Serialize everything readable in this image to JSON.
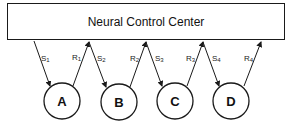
{
  "diagram": {
    "title": "Neural Control Center",
    "colors": {
      "stroke": "#1a1a1a",
      "background": "#ffffff"
    },
    "nodes": [
      {
        "id": "A",
        "label": "A"
      },
      {
        "id": "B",
        "label": "B"
      },
      {
        "id": "C",
        "label": "C"
      },
      {
        "id": "D",
        "label": "D"
      }
    ],
    "edges": [
      {
        "label": "S",
        "sub": "1",
        "from": "Neural Control Center",
        "to": "A"
      },
      {
        "label": "R",
        "sub": "1",
        "from": "A",
        "to": "Neural Control Center"
      },
      {
        "label": "S",
        "sub": "2",
        "from": "Neural Control Center",
        "to": "B"
      },
      {
        "label": "R",
        "sub": "2",
        "from": "B",
        "to": "Neural Control Center"
      },
      {
        "label": "S",
        "sub": "3",
        "from": "Neural Control Center",
        "to": "C"
      },
      {
        "label": "R",
        "sub": "3",
        "from": "C",
        "to": "Neural Control Center"
      },
      {
        "label": "S",
        "sub": "4",
        "from": "Neural Control Center",
        "to": "D"
      },
      {
        "label": "R",
        "sub": "4",
        "from": "D",
        "to": "Neural Control Center"
      }
    ]
  }
}
